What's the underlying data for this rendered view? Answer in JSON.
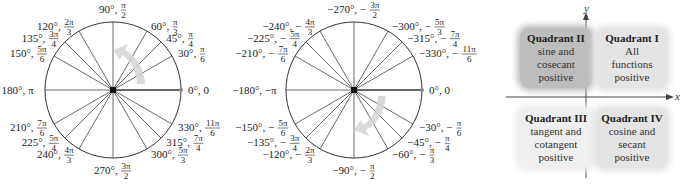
{
  "positive_circle": {
    "labels": [
      {
        "deg": "0°, 0",
        "angle": 0
      },
      {
        "deg": "30°,",
        "num": "π",
        "den": "6",
        "angle": 30
      },
      {
        "deg": "45°,",
        "num": "π",
        "den": "4",
        "angle": 45
      },
      {
        "deg": "60°,",
        "num": "π",
        "den": "3",
        "angle": 60
      },
      {
        "deg": "90°,",
        "num": "π",
        "den": "2",
        "angle": 90
      },
      {
        "deg": "120°,",
        "num": "2π",
        "den": "3",
        "angle": 120
      },
      {
        "deg": "135°,",
        "num": "3π",
        "den": "4",
        "angle": 135
      },
      {
        "deg": "150°,",
        "num": "5π",
        "den": "6",
        "angle": 150
      },
      {
        "deg": "180°, π",
        "angle": 180
      },
      {
        "deg": "210°,",
        "num": "7π",
        "den": "6",
        "angle": 210
      },
      {
        "deg": "225°,",
        "num": "5π",
        "den": "4",
        "angle": 225
      },
      {
        "deg": "240°,",
        "num": "4π",
        "den": "3",
        "angle": 240
      },
      {
        "deg": "270°,",
        "num": "3π",
        "den": "2",
        "angle": 270
      },
      {
        "deg": "300°,",
        "num": "5π",
        "den": "3",
        "angle": 300
      },
      {
        "deg": "315°,",
        "num": "7π",
        "den": "4",
        "angle": 315
      },
      {
        "deg": "330°,",
        "num": "11π",
        "den": "6",
        "angle": 330
      }
    ],
    "direction": "counterclockwise"
  },
  "negative_circle": {
    "labels": [
      {
        "deg": "0°, 0",
        "angle": 0
      },
      {
        "deg": "−30°, −",
        "num": "π",
        "den": "6",
        "angle": -30
      },
      {
        "deg": "−45°, −",
        "num": "π",
        "den": "4",
        "angle": -45
      },
      {
        "deg": "−60°, −",
        "num": "π",
        "den": "3",
        "angle": -60
      },
      {
        "deg": "−90°, −",
        "num": "π",
        "den": "2",
        "angle": -90
      },
      {
        "deg": "−120°, −",
        "num": "2π",
        "den": "3",
        "angle": -120
      },
      {
        "deg": "−135°, −",
        "num": "3π",
        "den": "4",
        "angle": -135
      },
      {
        "deg": "−150°, −",
        "num": "5π",
        "den": "6",
        "angle": -150
      },
      {
        "deg": "−180°, −π",
        "angle": -180
      },
      {
        "deg": "−210°, −",
        "num": "7π",
        "den": "6",
        "angle": -210
      },
      {
        "deg": "−225°, −",
        "num": "5π",
        "den": "4",
        "angle": -225
      },
      {
        "deg": "−240°, −",
        "num": "4π",
        "den": "3",
        "angle": -240
      },
      {
        "deg": "−270°, −",
        "num": "3π",
        "den": "2",
        "angle": -270
      },
      {
        "deg": "−300°, −",
        "num": "5π",
        "den": "3",
        "angle": -300
      },
      {
        "deg": "−315°, −",
        "num": "7π",
        "den": "4",
        "angle": -315
      },
      {
        "deg": "−330°, −",
        "num": "11π",
        "den": "6",
        "angle": -330
      }
    ],
    "direction": "clockwise"
  },
  "quadrants": {
    "axis_x": "x",
    "axis_y": "y",
    "q1": {
      "title": "Quadrant I",
      "line1": "All",
      "line2": "functions",
      "line3": "positive"
    },
    "q2": {
      "title": "Quadrant II",
      "line1": "sine and",
      "line2": "cosecant",
      "line3": "positive"
    },
    "q3": {
      "title": "Quadrant III",
      "line1": "tangent and",
      "line2": "cotangent",
      "line3": "positive"
    },
    "q4": {
      "title": "Quadrant IV",
      "line1": "cosine and",
      "line2": "secant",
      "line3": "positive"
    }
  }
}
